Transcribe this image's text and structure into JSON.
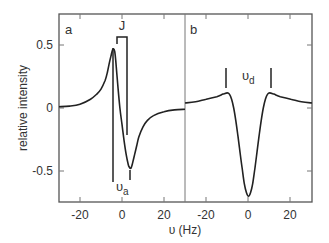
{
  "chart_data": [
    {
      "panel": "a",
      "type": "line",
      "title": "",
      "panel_label": "a",
      "xlabel": "υ (Hz)",
      "ylabel": "relative intensity",
      "xlim": [
        -30,
        30
      ],
      "ylim": [
        -0.75,
        0.75
      ],
      "xticks": [
        -20,
        0,
        20
      ],
      "xtick_labels": [
        "-20",
        "0",
        "20"
      ],
      "yticks": [
        0.5,
        0,
        -0.5
      ],
      "ytick_labels": [
        "0.5",
        "0",
        "-0.5"
      ],
      "grid": false,
      "x": [
        -30,
        -25,
        -20,
        -15,
        -12,
        -10,
        -8,
        -7,
        -6,
        -5,
        -4.5,
        -4,
        -3.5,
        -3,
        -2,
        -1,
        0,
        1,
        2,
        3,
        3.5,
        4,
        4.5,
        5,
        6,
        7,
        8,
        10,
        12,
        15,
        20,
        25,
        30
      ],
      "y": [
        0.01,
        0.015,
        0.03,
        0.07,
        0.11,
        0.15,
        0.22,
        0.28,
        0.36,
        0.43,
        0.46,
        0.47,
        0.45,
        0.38,
        0.18,
        0.0,
        -0.13,
        -0.26,
        -0.37,
        -0.45,
        -0.47,
        -0.48,
        -0.47,
        -0.44,
        -0.37,
        -0.3,
        -0.23,
        -0.15,
        -0.1,
        -0.06,
        -0.03,
        -0.015,
        -0.01
      ],
      "annotations": [
        {
          "text": "J",
          "type": "bracket",
          "x_from": -2.4,
          "x_to": 2.4
        },
        {
          "text": "υa",
          "type": "markers",
          "x": [
            -4,
            4
          ]
        }
      ]
    },
    {
      "panel": "b",
      "type": "line",
      "title": "",
      "panel_label": "b",
      "xlabel": "υ (Hz)",
      "xlim": [
        -30,
        30
      ],
      "ylim": [
        -0.75,
        0.75
      ],
      "xticks": [
        -20,
        0,
        20
      ],
      "xtick_labels": [
        "-20",
        "0",
        "20"
      ],
      "yticks": [
        0.5,
        0,
        -0.5
      ],
      "grid": false,
      "x": [
        -30,
        -25,
        -20,
        -15,
        -12,
        -10,
        -9,
        -8,
        -7,
        -6,
        -5,
        -4,
        -3,
        -2,
        -1,
        0,
        1,
        2,
        3,
        4,
        5,
        6,
        7,
        8,
        9,
        10,
        12,
        15,
        20,
        25,
        30
      ],
      "y": [
        0.04,
        0.05,
        0.07,
        0.09,
        0.11,
        0.12,
        0.11,
        0.07,
        0.0,
        -0.1,
        -0.22,
        -0.35,
        -0.48,
        -0.6,
        -0.67,
        -0.7,
        -0.67,
        -0.6,
        -0.48,
        -0.35,
        -0.22,
        -0.1,
        0.0,
        0.07,
        0.11,
        0.12,
        0.11,
        0.09,
        0.07,
        0.05,
        0.04
      ],
      "annotations": [
        {
          "text": "υd",
          "type": "markers",
          "x": [
            -10.5,
            10.5
          ]
        }
      ]
    }
  ],
  "labels": {
    "panel_a": "a",
    "panel_b": "b",
    "j": "J",
    "nu_a_main": "υ",
    "nu_a_sub": "a",
    "nu_d_main": "υ",
    "nu_d_sub": "d",
    "xlabel": "υ (Hz)",
    "ylabel": "relative intensity",
    "ytick_05": "0.5",
    "ytick_0": "0",
    "ytick_m05": "-0.5",
    "xtick_a_m20": "-20",
    "xtick_a_0": "0",
    "xtick_a_20": "20",
    "xtick_b_m20": "-20",
    "xtick_b_0": "0",
    "xtick_b_20": "20"
  },
  "colors": {
    "axis": "#444444",
    "curve": "#222222",
    "text": "#333333",
    "background": "#ffffff"
  }
}
